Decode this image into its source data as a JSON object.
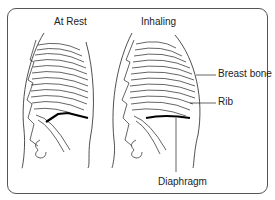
{
  "diagram": {
    "panels": [
      {
        "title": "At Rest"
      },
      {
        "title": "Inhaling"
      }
    ],
    "labels": {
      "breast_bone": "Breast bone",
      "rib": "Rib",
      "diaphragm": "Diaphragm"
    },
    "colors": {
      "line": "#222222",
      "frame": "#555555",
      "background": "#ffffff"
    }
  }
}
